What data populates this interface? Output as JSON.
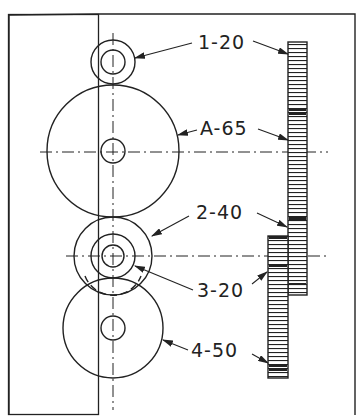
{
  "diagram": {
    "type": "gear-train-drawing",
    "colors": {
      "line": "#222222",
      "background": "#ffffff"
    },
    "labels": [
      {
        "id": "gear-1",
        "text": "1-20",
        "x": 198,
        "y": 49
      },
      {
        "id": "gear-a",
        "text": "A-65",
        "x": 200,
        "y": 135
      },
      {
        "id": "gear-2",
        "text": "2-40",
        "x": 196,
        "y": 219
      },
      {
        "id": "gear-3",
        "text": "3-20",
        "x": 197,
        "y": 297
      },
      {
        "id": "gear-4",
        "text": "4-50",
        "x": 191,
        "y": 357
      }
    ],
    "gears": [
      {
        "name": "1",
        "teeth": 20,
        "cx": 113,
        "cy": 62,
        "r": 22,
        "hub": 12
      },
      {
        "name": "A",
        "teeth": 65,
        "cx": 113,
        "cy": 151,
        "r": 66,
        "hub": 12
      },
      {
        "name": "2",
        "teeth": 40,
        "cx": 113,
        "cy": 256,
        "r": 39,
        "hub": 11
      },
      {
        "name": "3",
        "teeth": 20,
        "cx": 113,
        "cy": 256,
        "r": 22,
        "hub": 11
      },
      {
        "name": "4",
        "teeth": 50,
        "cx": 113,
        "cy": 328,
        "r": 50,
        "hub": 12
      }
    ]
  }
}
